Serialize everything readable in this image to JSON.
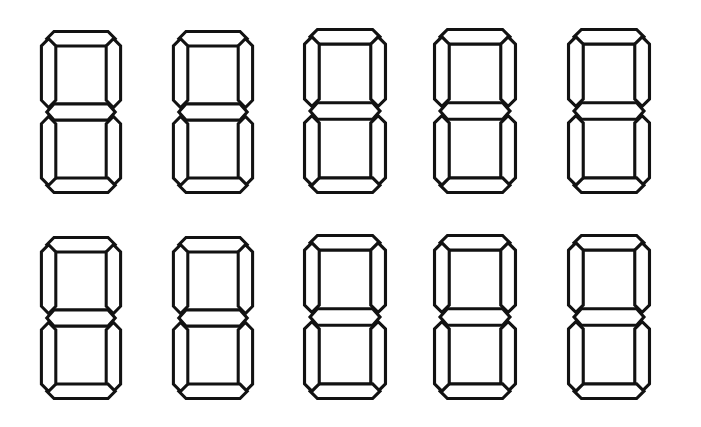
{
  "canvas": {
    "width": 701,
    "height": 427,
    "background_color": "#ffffff"
  },
  "figure": {
    "rows": 2,
    "columns": 5,
    "total_digits": 10,
    "stroke_color": "#121212",
    "fill_color": "#ffffff",
    "stroke_width": 3.4
  },
  "segment_names": [
    "top",
    "top-right",
    "bottom-right",
    "bottom",
    "bottom-left",
    "top-left",
    "middle"
  ],
  "digits": [
    {
      "index": 0,
      "row": 0,
      "column": 0,
      "glyph": "8",
      "segments_on": [
        "top",
        "top-right",
        "bottom-right",
        "bottom",
        "bottom-left",
        "top-left",
        "middle"
      ],
      "x": 36,
      "y": 26,
      "width": 90,
      "height": 172
    },
    {
      "index": 1,
      "row": 0,
      "column": 1,
      "glyph": "8",
      "segments_on": [
        "top",
        "top-right",
        "bottom-right",
        "bottom",
        "bottom-left",
        "top-left",
        "middle"
      ],
      "x": 168,
      "y": 26,
      "width": 90,
      "height": 172
    },
    {
      "index": 2,
      "row": 0,
      "column": 2,
      "glyph": "8",
      "segments_on": [
        "top",
        "top-right",
        "bottom-right",
        "bottom",
        "bottom-left",
        "top-left",
        "middle"
      ],
      "x": 299,
      "y": 24,
      "width": 92,
      "height": 174
    },
    {
      "index": 3,
      "row": 0,
      "column": 3,
      "glyph": "8",
      "segments_on": [
        "top",
        "top-right",
        "bottom-right",
        "bottom",
        "bottom-left",
        "top-left",
        "middle"
      ],
      "x": 429,
      "y": 24,
      "width": 92,
      "height": 174
    },
    {
      "index": 4,
      "row": 0,
      "column": 4,
      "glyph": "8",
      "segments_on": [
        "top",
        "top-right",
        "bottom-right",
        "bottom",
        "bottom-left",
        "top-left",
        "middle"
      ],
      "x": 563,
      "y": 24,
      "width": 92,
      "height": 174
    },
    {
      "index": 5,
      "row": 1,
      "column": 0,
      "glyph": "8",
      "segments_on": [
        "top",
        "top-right",
        "bottom-right",
        "bottom",
        "bottom-left",
        "top-left",
        "middle"
      ],
      "x": 36,
      "y": 232,
      "width": 90,
      "height": 172
    },
    {
      "index": 6,
      "row": 1,
      "column": 1,
      "glyph": "8",
      "segments_on": [
        "top",
        "top-right",
        "bottom-right",
        "bottom",
        "bottom-left",
        "top-left",
        "middle"
      ],
      "x": 168,
      "y": 232,
      "width": 90,
      "height": 172
    },
    {
      "index": 7,
      "row": 1,
      "column": 2,
      "glyph": "8",
      "segments_on": [
        "top",
        "top-right",
        "bottom-right",
        "bottom",
        "bottom-left",
        "top-left",
        "middle"
      ],
      "x": 299,
      "y": 230,
      "width": 92,
      "height": 174
    },
    {
      "index": 8,
      "row": 1,
      "column": 3,
      "glyph": "8",
      "segments_on": [
        "top",
        "top-right",
        "bottom-right",
        "bottom",
        "bottom-left",
        "top-left",
        "middle"
      ],
      "x": 429,
      "y": 230,
      "width": 92,
      "height": 174
    },
    {
      "index": 9,
      "row": 1,
      "column": 4,
      "glyph": "8",
      "segments_on": [
        "top",
        "top-right",
        "bottom-right",
        "bottom",
        "bottom-left",
        "top-left",
        "middle"
      ],
      "x": 563,
      "y": 230,
      "width": 92,
      "height": 174
    }
  ],
  "segment_geometry": {
    "viewbox": "0 0 100 190",
    "horizontal_top": "20,6 80,6 88,14 80,22 20,22 12,14",
    "horizontal_middle": "20,86 80,86 88,95 80,104 20,104 12,95",
    "horizontal_bottom": "20,168 80,168 88,176 80,184 20,184 12,176",
    "vertical_top_left": "6,22 14,14 22,22 22,82 14,90 6,82",
    "vertical_top_right": "78,22 86,14 94,22 94,82 86,90 78,82",
    "vertical_bottom_left": "6,108 14,100 22,108 22,168 14,176 6,168",
    "vertical_bottom_right": "78,108 86,100 94,108 94,168 86,176 78,168"
  }
}
